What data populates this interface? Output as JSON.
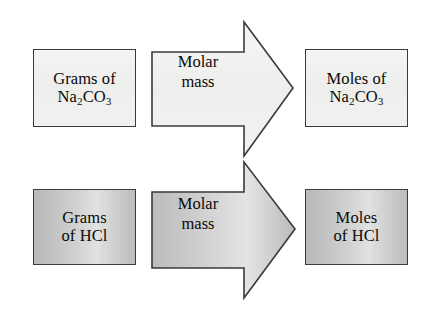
{
  "diagram": {
    "type": "flowchart",
    "rows": [
      {
        "id": "row-na2co3",
        "tone": "light",
        "source": {
          "line1": "Grams of",
          "line2_prefix": "Na",
          "line2_sub1": "2",
          "line2_mid": "CO",
          "line2_sub2": "3"
        },
        "arrow": {
          "line1": "Molar",
          "line2": "mass",
          "direction": "right"
        },
        "target": {
          "line1": "Moles of",
          "line2_prefix": "Na",
          "line2_sub1": "2",
          "line2_mid": "CO",
          "line2_sub2": "3"
        }
      },
      {
        "id": "row-hcl",
        "tone": "dark",
        "source": {
          "line1": "Grams",
          "line2": "of HCl"
        },
        "arrow": {
          "line1": "Molar",
          "line2": "mass",
          "direction": "right"
        },
        "target": {
          "line1": "Moles",
          "line2": "of HCl"
        }
      }
    ]
  },
  "colors": {
    "background": "#ffffff",
    "stroke": "#3a3a3a",
    "text": "#0a0a0a",
    "tone_light_fill": "#f1f1ef",
    "tone_dark_fill": "#c9c9c9"
  }
}
